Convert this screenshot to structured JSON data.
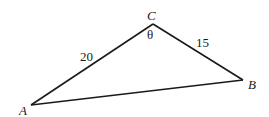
{
  "diagram": {
    "type": "triangle",
    "vertices": {
      "A": {
        "label": "A"
      },
      "B": {
        "label": "B"
      },
      "C": {
        "label": "C"
      }
    },
    "sides": {
      "AC": {
        "label": "20"
      },
      "CB": {
        "label": "15"
      },
      "AB": {
        "label": ""
      }
    },
    "angle_at_C": {
      "label": "θ"
    }
  }
}
